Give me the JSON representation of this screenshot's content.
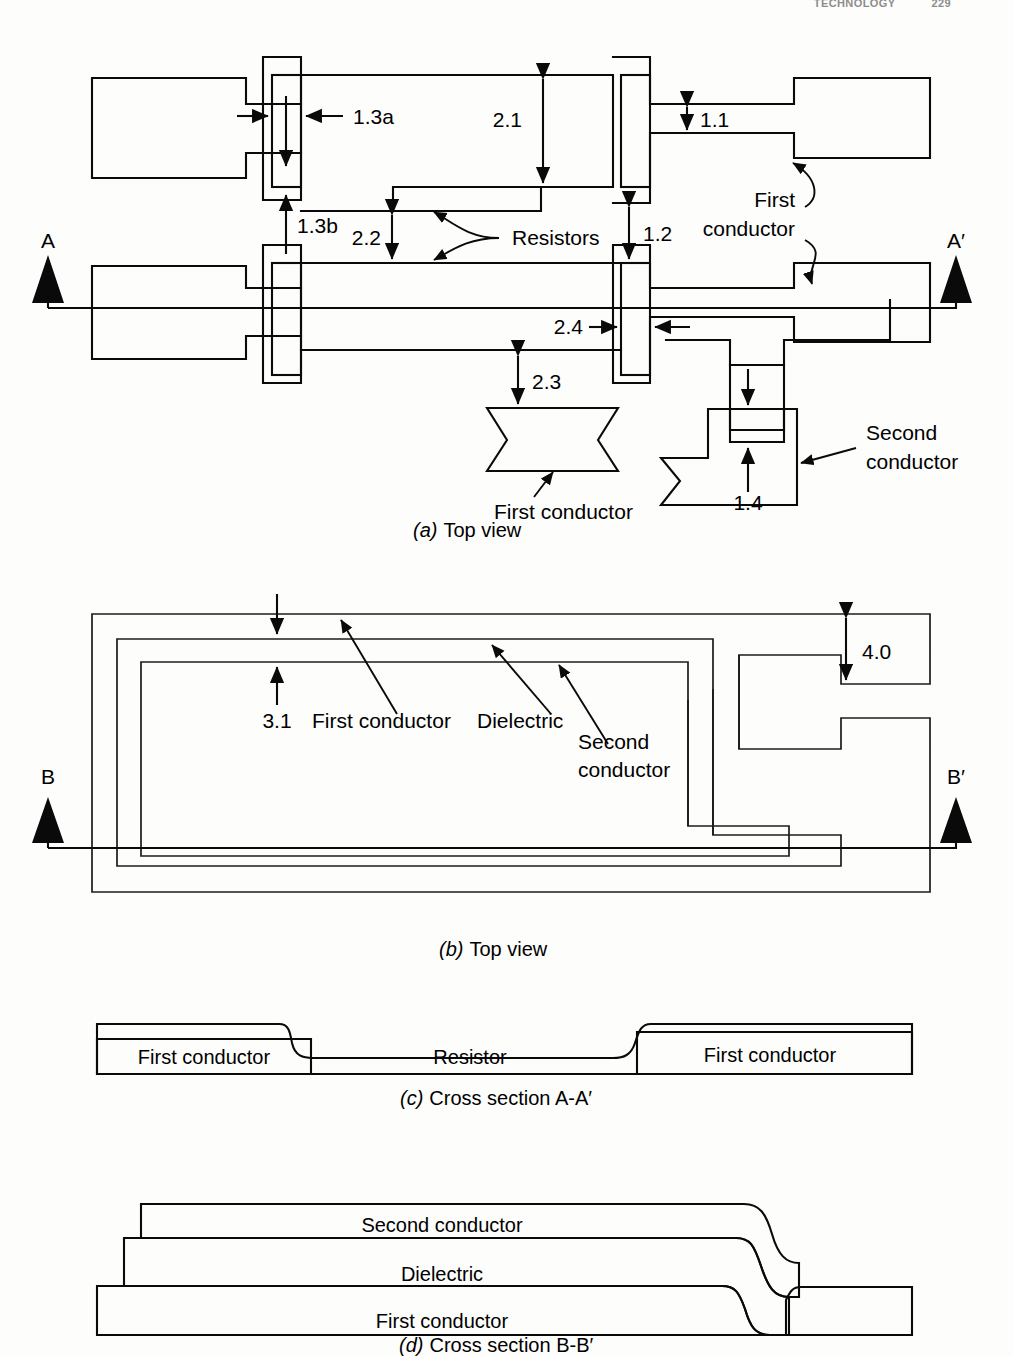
{
  "header": {
    "running_title": "TECHNOLOGY",
    "page_number": "229"
  },
  "figure": {
    "panels": [
      {
        "id": "a",
        "letter": "(a)",
        "caption": "Top view"
      },
      {
        "id": "b",
        "letter": "(b)",
        "caption": "Top view"
      },
      {
        "id": "c",
        "letter": "(c)",
        "caption": "Cross section A-A′"
      },
      {
        "id": "d",
        "letter": "(d)",
        "caption": "Cross section B-B′"
      }
    ]
  },
  "panel_a": {
    "section_marks": {
      "left": "A",
      "right": "A′"
    },
    "dimensions": [
      {
        "id": "1.3a",
        "label": "1.3a"
      },
      {
        "id": "1.3b",
        "label": "1.3b"
      },
      {
        "id": "2.1",
        "label": "2.1"
      },
      {
        "id": "2.2",
        "label": "2.2"
      },
      {
        "id": "1.1",
        "label": "1.1"
      },
      {
        "id": "1.2",
        "label": "1.2"
      },
      {
        "id": "2.4",
        "label": "2.4"
      },
      {
        "id": "2.3",
        "label": "2.3"
      },
      {
        "id": "1.4",
        "label": "1.4"
      }
    ],
    "annotations": [
      {
        "id": "resistors",
        "label": "Resistors"
      },
      {
        "id": "first-conductor-1",
        "line1": "First",
        "line2": "conductor"
      },
      {
        "id": "first-conductor-2",
        "label": "First conductor"
      },
      {
        "id": "second-conductor",
        "line1": "Second",
        "line2": "conductor"
      }
    ]
  },
  "panel_b": {
    "section_marks": {
      "left": "B",
      "right": "B′"
    },
    "dimensions": [
      {
        "id": "3.1",
        "label": "3.1"
      },
      {
        "id": "4.0",
        "label": "4.0"
      }
    ],
    "annotations": [
      {
        "id": "first-conductor",
        "label": "First conductor"
      },
      {
        "id": "dielectric",
        "label": "Dielectric"
      },
      {
        "id": "second-conductor",
        "line1": "Second",
        "line2": "conductor"
      }
    ]
  },
  "panel_c": {
    "layers": [
      {
        "id": "first-conductor-left",
        "label": "First conductor"
      },
      {
        "id": "resistor",
        "label": "Resistor"
      },
      {
        "id": "first-conductor-right",
        "label": "First conductor"
      }
    ]
  },
  "panel_d": {
    "layers": [
      {
        "id": "second-conductor",
        "label": "Second conductor"
      },
      {
        "id": "dielectric",
        "label": "Dielectric"
      },
      {
        "id": "first-conductor",
        "label": "First conductor"
      }
    ]
  },
  "colors": {
    "ink": "#0a0a0a",
    "paper": "#fdfdfc",
    "header_gray": "#8d8d8d"
  }
}
